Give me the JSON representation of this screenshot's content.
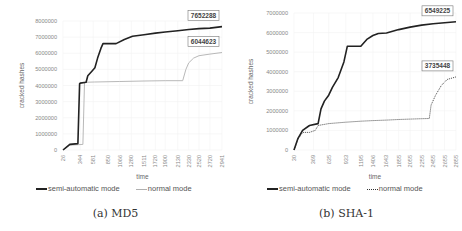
{
  "chart_data": [
    {
      "id": "md5",
      "type": "line",
      "caption": "(a) MD5",
      "xlabel": "time",
      "ylabel": "cracked hashes",
      "ylim": [
        0,
        8000000
      ],
      "yticks": [
        "0",
        "1000000",
        "2000000",
        "3000000",
        "4000000",
        "5000000",
        "6000000",
        "7000000",
        "8000000"
      ],
      "xticks": [
        "26",
        "344",
        "581",
        "850",
        "1066",
        "1280",
        "1511",
        "1720",
        "1900",
        "2130",
        "2330",
        "2520",
        "2720",
        "2941"
      ],
      "grid": true,
      "legend_position": "bottom",
      "series": [
        {
          "name": "semi-automatic mode",
          "style": "solid",
          "color": "#222222",
          "end_label": "7652288",
          "points": [
            [
              26,
              0
            ],
            [
              80,
              150000
            ],
            [
              150,
              350000
            ],
            [
              300,
              400000
            ],
            [
              330,
              4100000
            ],
            [
              344,
              4150000
            ],
            [
              450,
              4200000
            ],
            [
              480,
              4600000
            ],
            [
              560,
              4900000
            ],
            [
              610,
              5100000
            ],
            [
              660,
              5700000
            ],
            [
              720,
              6300000
            ],
            [
              760,
              6600000
            ],
            [
              900,
              6600000
            ],
            [
              1000,
              6600000
            ],
            [
              1150,
              6850000
            ],
            [
              1300,
              7050000
            ],
            [
              1511,
              7150000
            ],
            [
              1720,
              7250000
            ],
            [
              1900,
              7320000
            ],
            [
              2130,
              7400000
            ],
            [
              2330,
              7470000
            ],
            [
              2520,
              7530000
            ],
            [
              2720,
              7560000
            ],
            [
              2941,
              7652288
            ]
          ]
        },
        {
          "name": "normal mode",
          "style": "solid-light",
          "color": "#b0b0b0",
          "end_label": "6044623",
          "points": [
            [
              26,
              0
            ],
            [
              150,
              300000
            ],
            [
              390,
              350000
            ],
            [
              420,
              4200000
            ],
            [
              600,
              4220000
            ],
            [
              1066,
              4250000
            ],
            [
              1511,
              4280000
            ],
            [
              1900,
              4300000
            ],
            [
              2220,
              4300000
            ],
            [
              2280,
              5000000
            ],
            [
              2330,
              5400000
            ],
            [
              2420,
              5700000
            ],
            [
              2520,
              5850000
            ],
            [
              2720,
              5950000
            ],
            [
              2941,
              6044623
            ]
          ]
        }
      ]
    },
    {
      "id": "sha1",
      "type": "line",
      "caption": "(b) SHA-1",
      "xlabel": "time",
      "ylabel": "cracked hashes",
      "ylim": [
        0,
        7000000
      ],
      "yticks": [
        "0",
        "1000000",
        "2000000",
        "3000000",
        "4000000",
        "5000000",
        "6000000",
        "7000000"
      ],
      "xticks": [
        "30",
        "369",
        "635",
        "933",
        "1195",
        "1406",
        "1643",
        "1855",
        "2055",
        "2255",
        "2455",
        "2655",
        "2855"
      ],
      "grid": true,
      "legend_position": "bottom",
      "series": [
        {
          "name": "semi-automatic mode",
          "style": "solid",
          "color": "#222222",
          "end_label": "6549225",
          "points": [
            [
              30,
              0
            ],
            [
              100,
              600000
            ],
            [
              180,
              1000000
            ],
            [
              300,
              1250000
            ],
            [
              450,
              1350000
            ],
            [
              500,
              2100000
            ],
            [
              560,
              2500000
            ],
            [
              635,
              2800000
            ],
            [
              700,
              3200000
            ],
            [
              800,
              3700000
            ],
            [
              900,
              4500000
            ],
            [
              960,
              5300000
            ],
            [
              1100,
              5300000
            ],
            [
              1195,
              5300000
            ],
            [
              1300,
              5650000
            ],
            [
              1406,
              5850000
            ],
            [
              1500,
              5950000
            ],
            [
              1643,
              5980000
            ],
            [
              1855,
              6150000
            ],
            [
              2055,
              6280000
            ],
            [
              2255,
              6380000
            ],
            [
              2455,
              6450000
            ],
            [
              2655,
              6500000
            ],
            [
              2855,
              6549225
            ]
          ]
        },
        {
          "name": "normal mode",
          "style": "dotted",
          "color": "#333333",
          "end_label": "3735448",
          "points": [
            [
              30,
              0
            ],
            [
              100,
              550000
            ],
            [
              180,
              900000
            ],
            [
              300,
              900000
            ],
            [
              400,
              1000000
            ],
            [
              450,
              1250000
            ],
            [
              635,
              1350000
            ],
            [
              933,
              1420000
            ],
            [
              1195,
              1470000
            ],
            [
              1406,
              1500000
            ],
            [
              1643,
              1530000
            ],
            [
              1855,
              1560000
            ],
            [
              2055,
              1580000
            ],
            [
              2255,
              1600000
            ],
            [
              2390,
              1610000
            ],
            [
              2420,
              2300000
            ],
            [
              2500,
              2800000
            ],
            [
              2600,
              3300000
            ],
            [
              2700,
              3600000
            ],
            [
              2855,
              3735448
            ]
          ]
        }
      ]
    }
  ]
}
